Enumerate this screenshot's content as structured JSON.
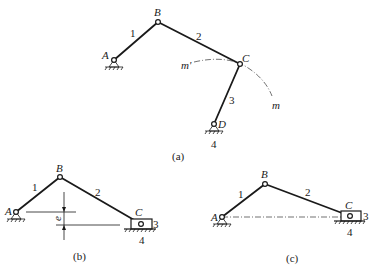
{
  "figure": {
    "subfigures": [
      {
        "caption": "(a)",
        "type": "four-bar linkage",
        "points": {
          "A": "A",
          "B": "B",
          "C": "C",
          "D": "D"
        },
        "links": {
          "l1": "1",
          "l2": "2",
          "l3": "3",
          "l4": "4"
        },
        "arc_labels": {
          "start": "m'",
          "end": "m"
        }
      },
      {
        "caption": "(b)",
        "type": "offset slider-crank",
        "points": {
          "A": "A",
          "B": "B",
          "C": "C"
        },
        "links": {
          "l1": "1",
          "l2": "2",
          "l3": "3",
          "l4": "4"
        },
        "offset_label": "e"
      },
      {
        "caption": "(c)",
        "type": "centric slider-crank",
        "points": {
          "A": "A",
          "B": "B",
          "C": "C"
        },
        "links": {
          "l1": "1",
          "l2": "2",
          "l3": "3",
          "l4": "4"
        }
      }
    ]
  },
  "colors": {
    "ink": "#1a1a1a",
    "background": "#ffffff"
  }
}
